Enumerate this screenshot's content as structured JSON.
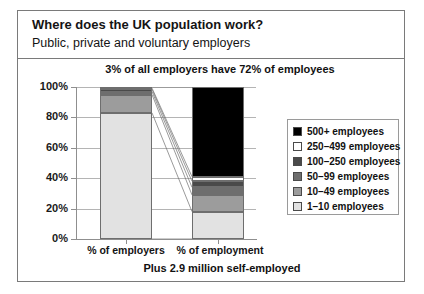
{
  "header": {
    "title": "Where does the UK population work?",
    "subtitle": "Public, private and voluntary employers"
  },
  "annotation": "3% of all employers have 72% of employees",
  "footnote": "Plus 2.9 million self-employed",
  "legend": {
    "items": [
      {
        "label": "500+ employees",
        "color": "#000000"
      },
      {
        "label": "250–499 employees",
        "color": "#ffffff"
      },
      {
        "label": "100–250 employees",
        "color": "#4a4a4a"
      },
      {
        "label": "50–99 employees",
        "color": "#6e6e6e"
      },
      {
        "label": "10–49 employees",
        "color": "#9c9c9c"
      },
      {
        "label": "1–10 employees",
        "color": "#e2e2e2"
      }
    ]
  },
  "chart_data": {
    "type": "bar",
    "title": "Where does the UK population work?",
    "subtitle": "Public, private and voluntary employers",
    "xlabel": "",
    "ylabel": "",
    "ylim": [
      0,
      100
    ],
    "ytick_labels": [
      "0%",
      "20%",
      "40%",
      "60%",
      "80%",
      "100%"
    ],
    "ytick_values": [
      0,
      20,
      40,
      60,
      80,
      100
    ],
    "categories": [
      "% of employers",
      "% of employment"
    ],
    "stacked": true,
    "grid": true,
    "legend_position": "right",
    "annotation": "3% of all employers have 72% of employees",
    "footnote": "Plus 2.9 million self-employed",
    "series": [
      {
        "name": "1–10 employees",
        "color": "#e2e2e2",
        "values": [
          83,
          18
        ]
      },
      {
        "name": "10–49 employees",
        "color": "#9c9c9c",
        "values": [
          12,
          11
        ]
      },
      {
        "name": "50–99 employees",
        "color": "#6e6e6e",
        "values": [
          2,
          5
        ]
      },
      {
        "name": "100–250 employees",
        "color": "#4a4a4a",
        "values": [
          1.5,
          4
        ]
      },
      {
        "name": "250–499 employees",
        "color": "#ffffff",
        "values": [
          0.8,
          3
        ]
      },
      {
        "name": "500+ employees",
        "color": "#000000",
        "values": [
          0.7,
          59
        ]
      }
    ]
  }
}
